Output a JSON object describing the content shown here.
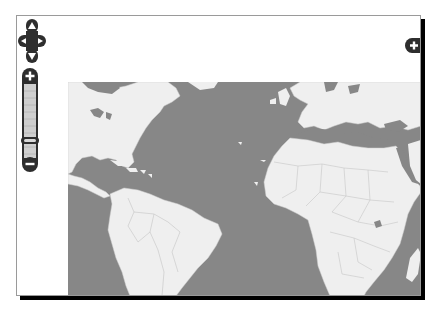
{
  "map": {
    "type": "world-map-atlantic",
    "ocean_color": "#878787",
    "land_color": "#efefef",
    "border_color": "#bdbdbd",
    "regions_visible": [
      "North America",
      "Central America",
      "Caribbean",
      "South America",
      "Europe",
      "Africa",
      "Middle East"
    ]
  },
  "controls": {
    "pan": {
      "up": {
        "icon": "arrow-up-icon"
      },
      "down": {
        "icon": "arrow-down-icon"
      },
      "left": {
        "icon": "arrow-left-icon"
      },
      "right": {
        "icon": "arrow-right-icon"
      }
    },
    "zoom": {
      "zoom_in_label": "+",
      "zoom_out_label": "−",
      "levels": 11,
      "current_level_index": 9
    },
    "layer_switcher": {
      "label": "+"
    }
  },
  "colors": {
    "control_fill": "#2e2e2e",
    "zoom_track": "#cfcfcf",
    "frame_shadow": "#000000"
  }
}
